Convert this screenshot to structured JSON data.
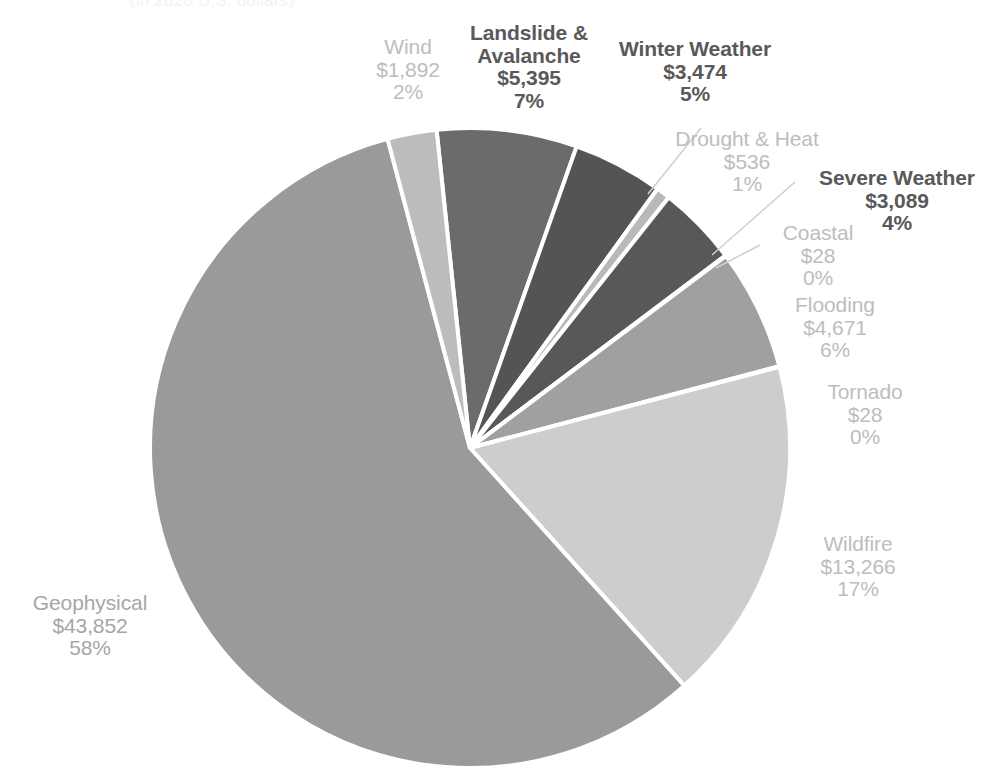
{
  "chart_data": {
    "type": "pie",
    "title": "(in 2020 U.S. dollars)",
    "value_prefix": "$",
    "value_unit": "millions",
    "total": 76231,
    "start_angle_deg": -96,
    "direction": "clockwise",
    "center": {
      "x": 470,
      "y": 448
    },
    "radius": 320,
    "slice_gap_color": "#ffffff",
    "categories": [
      "Landslide & Avalanche",
      "Winter Weather",
      "Drought & Heat",
      "Severe Weather",
      "Coastal",
      "Flooding",
      "Tornado",
      "Wildfire",
      "Geophysical",
      "Wind"
    ],
    "values": [
      5395,
      3474,
      536,
      3089,
      28,
      4671,
      28,
      13266,
      43852,
      1892
    ],
    "percents": [
      7,
      5,
      1,
      4,
      0,
      6,
      0,
      17,
      58,
      2
    ],
    "colors": [
      "#6b6b6b",
      "#545454",
      "#b9b9b9",
      "#585858",
      "#cfcfcf",
      "#a0a0a0",
      "#e0e0e0",
      "#cdcdcd",
      "#9a9a9a",
      "#bcbcbc"
    ],
    "legend": "none",
    "grid": false
  },
  "labels": [
    {
      "key": "wind",
      "name": "Wind",
      "value": "$1,892",
      "percent": "2%",
      "style": "light",
      "align": "center",
      "x": 360,
      "y": 36,
      "width": 96,
      "font_size": 21
    },
    {
      "key": "landslide-avalanche",
      "name": "Landslide &\nAvalanche",
      "name_line1": "Landslide &",
      "name_line2": "Avalanche",
      "value": "$5,395",
      "percent": "7%",
      "style": "dark",
      "align": "center",
      "x": 463,
      "y": 22,
      "width": 132,
      "font_size": 21
    },
    {
      "key": "winter-weather",
      "name": "Winter Weather",
      "value": "$3,474",
      "percent": "5%",
      "style": "dark",
      "align": "center",
      "x": 611,
      "y": 38,
      "width": 168,
      "font_size": 21
    },
    {
      "key": "drought-heat",
      "name": "Drought & Heat",
      "value": "$536",
      "percent": "1%",
      "style": "light",
      "align": "center",
      "x": 665,
      "y": 128,
      "width": 164,
      "font_size": 21
    },
    {
      "key": "severe-weather",
      "name": "Severe Weather",
      "value": "$3,089",
      "percent": "4%",
      "style": "dark",
      "align": "center",
      "x": 808,
      "y": 167,
      "width": 178,
      "font_size": 21
    },
    {
      "key": "coastal",
      "name": "Coastal",
      "value": "$28",
      "percent": "0%",
      "style": "light",
      "align": "center",
      "x": 770,
      "y": 222,
      "width": 96,
      "font_size": 21
    },
    {
      "key": "flooding",
      "name": "Flooding",
      "value": "$4,671",
      "percent": "6%",
      "style": "light",
      "align": "center",
      "x": 780,
      "y": 294,
      "width": 110,
      "font_size": 21
    },
    {
      "key": "tornado",
      "name": "Tornado",
      "value": "$28",
      "percent": "0%",
      "style": "light",
      "align": "center",
      "x": 812,
      "y": 381,
      "width": 106,
      "font_size": 21
    },
    {
      "key": "wildfire",
      "name": "Wildfire",
      "value": "$13,266",
      "percent": "17%",
      "style": "light",
      "align": "center",
      "x": 794,
      "y": 533,
      "width": 128,
      "font_size": 21
    },
    {
      "key": "geophysical",
      "name": "Geophysical",
      "value": "$43,852",
      "percent": "58%",
      "style": "mid",
      "align": "center",
      "x": 15,
      "y": 592,
      "width": 150,
      "font_size": 21
    }
  ],
  "leader_lines": [
    {
      "key": "winter-weather-leader",
      "x1": 701,
      "y1": 128,
      "x2": 648,
      "y2": 194
    },
    {
      "key": "severe-weather-leader",
      "x1": 795,
      "y1": 182,
      "x2": 712,
      "y2": 255
    },
    {
      "key": "coastal-leader",
      "x1": 760,
      "y1": 245,
      "x2": 716,
      "y2": 268
    }
  ]
}
